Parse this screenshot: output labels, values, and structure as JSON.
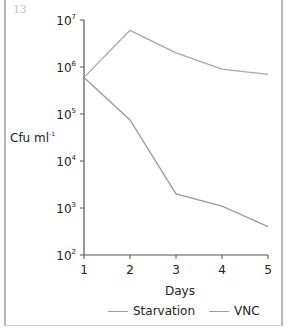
{
  "figure_number": "13",
  "chart_data": {
    "type": "line",
    "title": "",
    "xlabel": "Days",
    "ylabel": "Cfu ml-1",
    "ylabel_base": "Cfu ml",
    "ylabel_sup": "-1",
    "yscale": "log",
    "ylim": [
      100,
      10000000
    ],
    "xlim": [
      1,
      5
    ],
    "x": [
      1,
      2,
      3,
      4,
      5
    ],
    "x_tick_labels": [
      "1",
      "2",
      "3",
      "4",
      "5"
    ],
    "y_ticks": [
      {
        "base": "10",
        "exp": "2",
        "value": 100
      },
      {
        "base": "10",
        "exp": "3",
        "value": 1000
      },
      {
        "base": "10",
        "exp": "4",
        "value": 10000
      },
      {
        "base": "10",
        "exp": "5",
        "value": 100000
      },
      {
        "base": "10",
        "exp": "6",
        "value": 1000000
      },
      {
        "base": "10",
        "exp": "7",
        "value": 10000000
      }
    ],
    "grid": false,
    "legend_position": "bottom",
    "series": [
      {
        "name": "Starvation",
        "color": "#a8a8a8",
        "values": [
          600000,
          6000000,
          2000000,
          900000,
          700000
        ]
      },
      {
        "name": "VNC",
        "color": "#9a9a9a",
        "values": [
          600000,
          75000,
          2000,
          1100,
          400
        ]
      }
    ]
  },
  "legend": {
    "items": [
      {
        "label": "Starvation"
      },
      {
        "label": "VNC"
      }
    ]
  }
}
